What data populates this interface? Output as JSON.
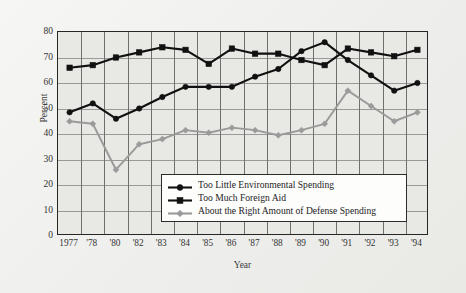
{
  "chart_data": {
    "type": "line",
    "title": "",
    "xlabel": "Year",
    "ylabel": "Percent",
    "ylim": [
      0,
      80
    ],
    "ytick_step": 10,
    "yticks": [
      80,
      70,
      60,
      50,
      40,
      30,
      20,
      10,
      0
    ],
    "grid": "both",
    "legend_position": "inside-bottom-right",
    "categories": [
      "1977",
      "'78",
      "'80",
      "'82",
      "'83",
      "'84",
      "'85",
      "'86",
      "'87",
      "'88",
      "'89",
      "'90",
      "'91",
      "'92",
      "'93",
      "'94"
    ],
    "series": [
      {
        "name": "Too Little Environmental Spending",
        "marker": "circle",
        "color": "#111111",
        "values": [
          48.5,
          52.0,
          46.0,
          50.0,
          54.5,
          58.5,
          58.5,
          58.5,
          62.5,
          65.5,
          72.5,
          76.0,
          69.0,
          63.0,
          57.0,
          60.0
        ]
      },
      {
        "name": "Too Much Foreign Aid",
        "marker": "square",
        "color": "#111111",
        "values": [
          66.0,
          67.0,
          70.0,
          72.0,
          74.0,
          73.0,
          67.5,
          73.5,
          71.5,
          71.5,
          69.0,
          67.0,
          73.5,
          72.0,
          70.5,
          73.0
        ]
      },
      {
        "name": "About the Right Amount of Defense Spending",
        "marker": "diamond",
        "color": "#9a9a9a",
        "values": [
          45.0,
          44.0,
          26.0,
          36.0,
          38.0,
          41.5,
          40.5,
          42.5,
          41.5,
          39.5,
          41.5,
          44.0,
          57.0,
          51.0,
          45.0,
          48.5
        ]
      }
    ]
  },
  "legend": {
    "items": [
      {
        "label": "Too Little Environmental Spending"
      },
      {
        "label": "Too Much Foreign Aid"
      },
      {
        "label": "About the Right Amount of Defense Spending"
      }
    ]
  },
  "colors": {
    "page_background": "#f2f2f0",
    "plot_background": "#e8e8e5",
    "axis": "#262626",
    "gridline_horizontal": "#9a9a98",
    "gridline_vertical": "#6f6f6e",
    "series_dark": "#111111",
    "series_gray": "#9a9a9a",
    "legend_background": "#fdfdfc"
  }
}
